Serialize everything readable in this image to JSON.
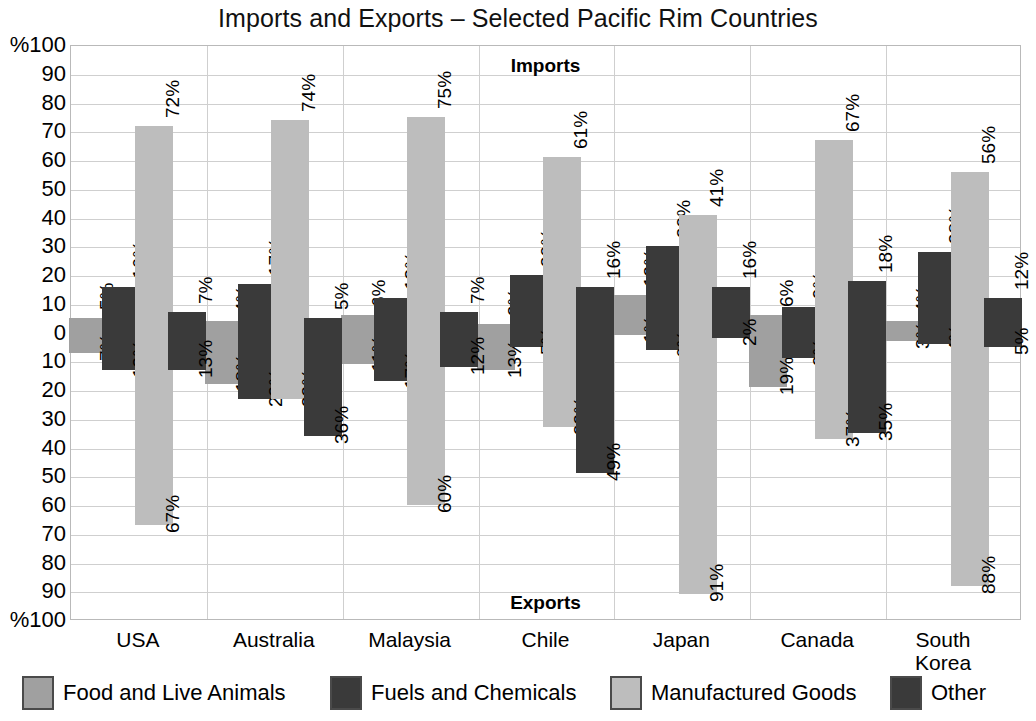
{
  "chart_data": {
    "type": "bar",
    "title": "Imports and Exports – Selected Pacific Rim Countries",
    "xlabel": "",
    "ylabel": "%",
    "ylim": [
      -100,
      100
    ],
    "grid": true,
    "legend_position": "bottom",
    "upper_half_label": "Imports",
    "lower_half_label": "Exports",
    "axis_unit_top": "%100",
    "axis_unit_bottom": "%100",
    "y_ticks": [
      "%100",
      "90",
      "80",
      "70",
      "60",
      "50",
      "40",
      "30",
      "20",
      "10",
      "0",
      "10",
      "20",
      "30",
      "40",
      "50",
      "60",
      "70",
      "80",
      "90",
      "%100"
    ],
    "categories": [
      "USA",
      "Australia",
      "Malaysia",
      "Chile",
      "Japan",
      "Canada",
      "South Korea"
    ],
    "series": [
      {
        "name": "Food and Live Animals",
        "color": "#a0a0a0",
        "imports": [
          5,
          4,
          6,
          3,
          13,
          6,
          4
        ],
        "exports": [
          7,
          18,
          11,
          13,
          1,
          19,
          3
        ],
        "import_labels": [
          "5%",
          "4%",
          "6%",
          "3%",
          "13%",
          "6%",
          "4%"
        ],
        "export_labels": [
          "7%",
          "18%",
          "11%",
          "13%",
          "1%",
          "19%",
          "3%"
        ]
      },
      {
        "name": "Fuels and Chemicals",
        "color": "#3a3a3a",
        "imports": [
          16,
          17,
          12,
          20,
          30,
          9,
          28
        ],
        "exports": [
          13,
          23,
          17,
          5,
          6,
          9,
          4
        ],
        "import_labels": [
          "16%",
          "17%",
          "12%",
          "20%",
          "30%",
          "9%",
          "28%"
        ],
        "export_labels": [
          "13%",
          "23%",
          "17%",
          "5%",
          "6%",
          "9%",
          "4%"
        ]
      },
      {
        "name": "Manufactured Goods",
        "color": "#bdbdbd",
        "imports": [
          72,
          74,
          75,
          61,
          41,
          67,
          56
        ],
        "exports": [
          67,
          23,
          60,
          33,
          91,
          37,
          88
        ],
        "import_labels": [
          "72%",
          "74%",
          "75%",
          "61%",
          "41%",
          "67%",
          "56%"
        ],
        "export_labels": [
          "67%",
          "23%",
          "60%",
          "33%",
          "91%",
          "37%",
          "88%"
        ]
      },
      {
        "name": "Other",
        "color": "#3a3a3a",
        "imports": [
          7,
          5,
          7,
          16,
          16,
          18,
          12
        ],
        "exports": [
          13,
          36,
          12,
          49,
          2,
          35,
          5
        ],
        "import_labels": [
          "7%",
          "5%",
          "7%",
          "16%",
          "16%",
          "18%",
          "12%"
        ],
        "export_labels": [
          "13%",
          "36%",
          "12%",
          "49%",
          "2%",
          "35%",
          "5%"
        ]
      }
    ]
  },
  "legend": [
    {
      "label": "Food and Live Animals",
      "key": "food"
    },
    {
      "label": "Fuels and Chemicals",
      "key": "fuels"
    },
    {
      "label": "Manufactured Goods",
      "key": "manuf"
    },
    {
      "label": "Other",
      "key": "other"
    }
  ]
}
